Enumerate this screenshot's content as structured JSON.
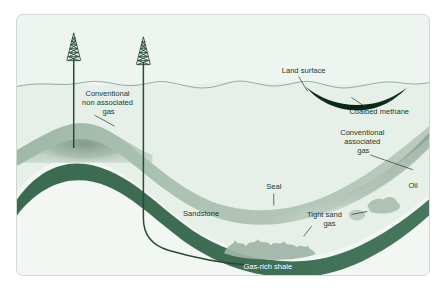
{
  "figure": {
    "background_color": "#eef4ef",
    "border_color": "#d2d6d4",
    "page_background": "#ffffff"
  },
  "colors": {
    "shale_dark_green": "#3d6b52",
    "sandstone_band": "#a8bfb2",
    "gas_accumulation": "#8fa99a",
    "oil_accumulation": "#b9c7bd",
    "coal_seam": "#0d2a1b",
    "text_dark": "#1d3a2c",
    "text_light": "#ffffff",
    "well_casing": "#2a4a38",
    "surface_line": "#7d9a8b"
  },
  "labels": [
    {
      "id": "conventional-non-associated-gas",
      "lines": [
        "Conventional",
        "non associated",
        "gas"
      ],
      "x": 92,
      "y": 82,
      "anchor": "middle",
      "color": "#1d3a2c",
      "leader": "M 78,101 L 98,112"
    },
    {
      "id": "land-surface",
      "lines": [
        "Land surface"
      ],
      "x": 288,
      "y": 58,
      "anchor": "middle",
      "color": "#1d3a2c",
      "leader": "M 283,62 L 292,77"
    },
    {
      "id": "coalbed-methane",
      "lines": [
        "Coalbed methane"
      ],
      "x": 364,
      "y": 100,
      "anchor": "middle",
      "color": "#1d3a2c",
      "leader": "M 352,94 L 336,83"
    },
    {
      "id": "conventional-associated-gas",
      "lines": [
        "Conventional",
        "associated",
        "gas"
      ],
      "x": 348,
      "y": 121,
      "anchor": "middle",
      "color": "#1d3a2c",
      "leader": "M 355,141 L 398,156"
    },
    {
      "id": "oil",
      "lines": [
        "Oil"
      ],
      "x": 398,
      "y": 174,
      "anchor": "middle",
      "color": "#1d3a2c",
      "leader": ""
    },
    {
      "id": "seal",
      "lines": [
        "Seal"
      ],
      "x": 258,
      "y": 175,
      "anchor": "middle",
      "color": "#1d3a2c",
      "leader": "M 258,180 L 258,192"
    },
    {
      "id": "sandstone",
      "lines": [
        "Sandstone"
      ],
      "x": 185,
      "y": 203,
      "anchor": "middle",
      "color": "#1d3a2c",
      "leader": ""
    },
    {
      "id": "tight-sand-gas",
      "lines": [
        "Tight sand",
        "gas"
      ],
      "x": 310,
      "y": 204,
      "anchor": "middle",
      "color": "#1d3a2c",
      "leader": "M 336,201 L 352,198 M 296,213 L 288,223"
    },
    {
      "id": "gas-rich-shale",
      "lines": [
        "Gas-rich shale"
      ],
      "x": 252,
      "y": 256,
      "anchor": "middle",
      "color": "#ffffff",
      "leader": ""
    }
  ],
  "features": {
    "derrick_left": {
      "name": "drilling-derrick-vertical-well",
      "x": 57,
      "top": 32,
      "bottom": 75
    },
    "derrick_right": {
      "name": "drilling-derrick-horizontal-well",
      "x": 127,
      "top": 36,
      "bottom": 78
    },
    "well_vertical": {
      "name": "vertical-well-bore",
      "depth": 131
    },
    "well_horizontal": {
      "name": "horizontal-well-bore",
      "depth": 232
    },
    "land_surface": {
      "name": "land-surface-line"
    },
    "coal_seam": {
      "name": "coalbed-methane-seam"
    },
    "sandstone_band": {
      "name": "sandstone-reservoir-band"
    },
    "shale_band": {
      "name": "gas-rich-shale-band"
    },
    "anticline_dome": {
      "name": "anticline-trap-dome"
    },
    "tight_sand_blobs": {
      "name": "tight-sand-gas-accumulations"
    }
  }
}
